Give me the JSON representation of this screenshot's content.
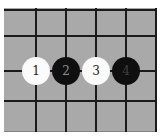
{
  "diagram": {
    "type": "go-board-diagram",
    "background_color": "#ffffff",
    "board_color": "#a9a9a9",
    "line_color": "#1b1b1b",
    "grid": {
      "columns_visible": 5,
      "rows_visible": 4,
      "vertical_lines_x": [
        31,
        61,
        91,
        121,
        151
      ],
      "horizontal_lines_y": [
        1,
        27,
        62,
        92
      ]
    },
    "stones": [
      {
        "number": "1",
        "color": "white",
        "cx": 32,
        "cy": 63,
        "fill": "#fbfbfb",
        "number_color": "#1d1d1d"
      },
      {
        "number": "2",
        "color": "black",
        "cx": 62,
        "cy": 63,
        "fill": "#0f0f0f",
        "number_color": "#8e8e8e"
      },
      {
        "number": "3",
        "color": "white",
        "cx": 92,
        "cy": 63,
        "fill": "#fbfbfb",
        "number_color": "#1d1d1d"
      },
      {
        "number": "4",
        "color": "black",
        "cx": 122,
        "cy": 63,
        "fill": "#0f0f0f",
        "number_color": "#3f3f3f"
      }
    ]
  }
}
